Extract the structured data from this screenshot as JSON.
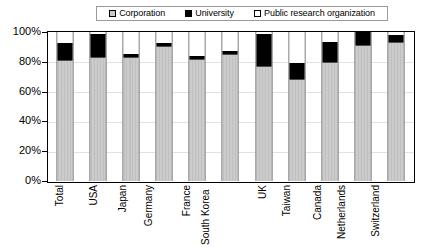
{
  "chart_data": {
    "type": "bar",
    "subtype": "stacked-percent",
    "title": "",
    "subtitle": "",
    "xlabel": "",
    "ylabel": "",
    "ylim": [
      0,
      100
    ],
    "yunit": "%",
    "ytick_labels": [
      "100%",
      "80%",
      "60%",
      "40%",
      "20%",
      "0%"
    ],
    "ytick_values": [
      100,
      80,
      60,
      40,
      20,
      0
    ],
    "grid": true,
    "legend_position": "top-center",
    "categories": [
      "Total",
      "USA",
      "Japan",
      "Germany",
      "France",
      "South Korea",
      "UK",
      "Taiwan",
      "Canada",
      "Netherlands",
      "Switzerland"
    ],
    "series": [
      {
        "name": "Corporation",
        "color": "#c9c9c9",
        "values": [
          81,
          83,
          83,
          90.5,
          82,
          85,
          77,
          68.5,
          80,
          91,
          93
        ]
      },
      {
        "name": "University",
        "color": "#000000",
        "values": [
          11.5,
          16,
          2,
          2,
          2,
          2.5,
          21.5,
          10.5,
          13.5,
          9,
          5
        ]
      },
      {
        "name": "Public research organization",
        "color": "#ffffff",
        "values": [
          7.5,
          1,
          15,
          7.5,
          16,
          12.5,
          1.5,
          21,
          6.5,
          0,
          2
        ]
      }
    ]
  },
  "legend": {
    "items": [
      {
        "label": "Corporation",
        "swatch": "corp"
      },
      {
        "label": "University",
        "swatch": "univ"
      },
      {
        "label": "Public research organization",
        "swatch": "pro"
      }
    ]
  },
  "axes": {
    "y": {
      "ticks": [
        "100%",
        "80%",
        "60%",
        "40%",
        "20%",
        "0%"
      ]
    },
    "x": {
      "ticks": [
        "Total",
        "USA",
        "Japan",
        "Germany",
        "France",
        "South Korea",
        "UK",
        "Taiwan",
        "Canada",
        "Netherlands",
        "Switzerland"
      ]
    }
  },
  "colors": {
    "corporation": "#c9c9c9",
    "university": "#000000",
    "public_research_organization": "#ffffff",
    "axis": "#000000",
    "grid": "#e2e2e2",
    "background": "#ffffff"
  }
}
